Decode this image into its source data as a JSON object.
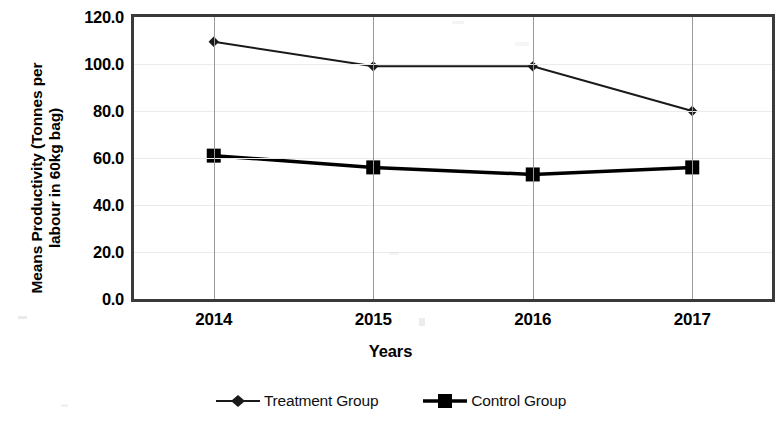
{
  "chart_data": {
    "type": "line",
    "title": "",
    "xlabel": "Years",
    "ylabel": "Means Productivity (Tonnes per labour in 60kg bag)",
    "ylabel_lines": [
      "Means Productivity (Tonnes per",
      "labour in 60kg bag)"
    ],
    "categories": [
      "2014",
      "2015",
      "2016",
      "2017"
    ],
    "x_tick_labels": [
      "2014",
      "2015",
      "2016",
      "2017"
    ],
    "y_tick_labels": [
      "0.0",
      "20.0",
      "40.0",
      "60.0",
      "80.0",
      "100.0",
      "120.0"
    ],
    "y_tick_values": [
      0,
      20,
      40,
      60,
      80,
      100,
      120
    ],
    "ylim": [
      0,
      120
    ],
    "grid": {
      "horizontal": true,
      "vertical": true
    },
    "legend_position": "bottom-center",
    "series": [
      {
        "name": "Treatment Group",
        "marker": "diamond",
        "color": "#1a1a1a",
        "line_width": 2,
        "values": [
          109.5,
          99.0,
          99.0,
          80.0
        ]
      },
      {
        "name": "Control Group",
        "marker": "square",
        "color": "#000000",
        "line_width": 3.5,
        "values": [
          61.0,
          56.0,
          53.0,
          56.0
        ]
      }
    ]
  },
  "legend": {
    "entries": [
      {
        "label": "Treatment Group",
        "marker": "diamond-marker-icon"
      },
      {
        "label": "Control Group",
        "marker": "square-marker-icon"
      }
    ]
  },
  "axis_titles": {
    "x": "Years",
    "y_line1": "Means Productivity (Tonnes per",
    "y_line2": "labour in 60kg bag)"
  },
  "colors": {
    "frame": "#3a3a3a",
    "gridline_horizontal": "#efeaea",
    "gridline_vertical": "#9a9a9a",
    "series_treatment": "#1a1a1a",
    "series_control": "#000000",
    "background": "#ffffff",
    "text": "#000000"
  }
}
